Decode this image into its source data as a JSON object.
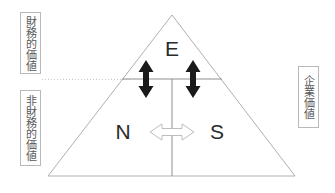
{
  "diagram": {
    "title_present": false,
    "shape": "pyramid-triangle",
    "labels": {
      "financial_value": "財務的価値",
      "nonfinancial_value": "非財務的価値",
      "corporate_value": "企業価値"
    },
    "segments": {
      "top": "E",
      "bottom_left": "N",
      "bottom_right": "S"
    },
    "arrows": {
      "left_vertical": "double-headed-vertical-arrow-filled",
      "right_vertical": "double-headed-vertical-arrow-filled",
      "center_horizontal": "double-headed-horizontal-arrow-outline"
    },
    "colors": {
      "outline": "#b0b0b0",
      "arrow_fill": "#1a1a1a",
      "arrow_outline": "#bdbdbd",
      "label_border": "#b9b9b9",
      "label_text": "#585858",
      "glyph_text": "#2b2b2b",
      "dotted_guide": "#c8c8c8",
      "background": "#ffffff"
    },
    "geometry": {
      "apex_x": 172,
      "apex_y": 15,
      "base_left_x": 48,
      "base_right_x": 295,
      "base_y": 176,
      "divider_y": 79,
      "center_x": 172
    }
  }
}
